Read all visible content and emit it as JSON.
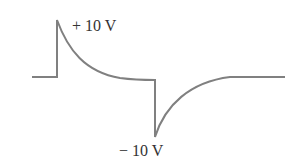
{
  "diagram": {
    "waveform_color": "#808080",
    "labels": {
      "positive_peak": "+ 10 V",
      "negative_peak": "− 10 V"
    },
    "baseline_level_v": 0,
    "positive_peak_v": 10,
    "negative_peak_v": -10
  }
}
